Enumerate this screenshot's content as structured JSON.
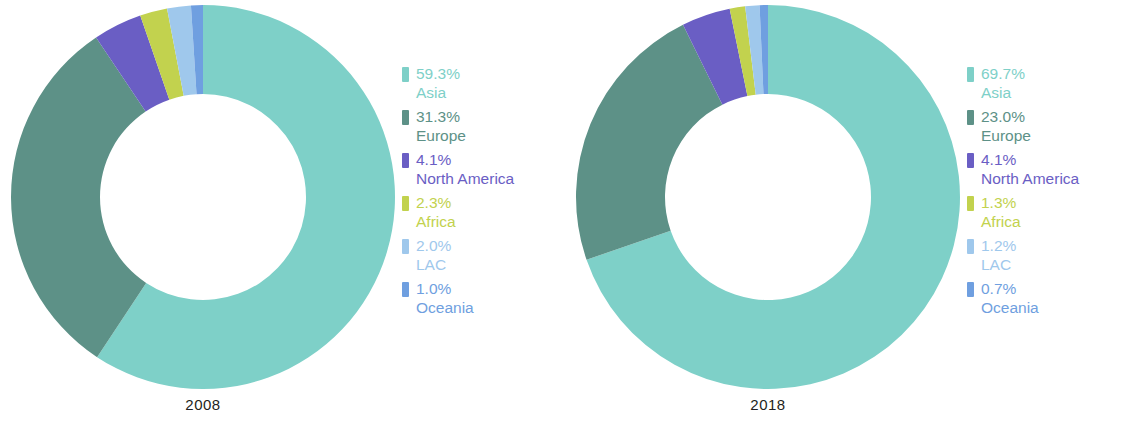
{
  "chart_data": [
    {
      "type": "pie",
      "title": "2008",
      "subtitle": "",
      "xlabel": "",
      "ylabel": "",
      "donut": true,
      "legend_position": "right",
      "grid": false,
      "categories": [
        "Asia",
        "Europe",
        "North America",
        "Africa",
        "LAC",
        "Oceania"
      ],
      "values": [
        59.3,
        31.3,
        4.1,
        2.3,
        2.0,
        1.0
      ],
      "value_labels": [
        "59.3%",
        "31.3%",
        "4.1%",
        "2.3%",
        "2.0%",
        "1.0%"
      ],
      "colors": [
        "#7ed0c8",
        "#5d9187",
        "#6a5ec4",
        "#c2d24e",
        "#9fc8ec",
        "#6f9fe0"
      ]
    },
    {
      "type": "pie",
      "title": "2018",
      "subtitle": "",
      "xlabel": "",
      "ylabel": "",
      "donut": true,
      "legend_position": "right",
      "grid": false,
      "categories": [
        "Asia",
        "Europe",
        "North America",
        "Africa",
        "LAC",
        "Oceania"
      ],
      "values": [
        69.7,
        23.0,
        4.1,
        1.3,
        1.2,
        0.7
      ],
      "value_labels": [
        "69.7%",
        "23.0%",
        "4.1%",
        "1.3%",
        "1.2%",
        "0.7%"
      ],
      "colors": [
        "#7ed0c8",
        "#5d9187",
        "#6a5ec4",
        "#c2d24e",
        "#9fc8ec",
        "#6f9fe0"
      ]
    }
  ],
  "charts": [
    {
      "year_label": "2008",
      "legend": [
        {
          "pct": "59.3%",
          "name": "Asia",
          "color": "#7ed0c8"
        },
        {
          "pct": "31.3%",
          "name": "Europe",
          "color": "#5d9187"
        },
        {
          "pct": "4.1%",
          "name": "North America",
          "color": "#6a5ec4"
        },
        {
          "pct": "2.3%",
          "name": "Africa",
          "color": "#c2d24e"
        },
        {
          "pct": "2.0%",
          "name": "LAC",
          "color": "#9fc8ec"
        },
        {
          "pct": "1.0%",
          "name": "Oceania",
          "color": "#6f9fe0"
        }
      ]
    },
    {
      "year_label": "2018",
      "legend": [
        {
          "pct": "69.7%",
          "name": "Asia",
          "color": "#7ed0c8"
        },
        {
          "pct": "23.0%",
          "name": "Europe",
          "color": "#5d9187"
        },
        {
          "pct": "4.1%",
          "name": "North America",
          "color": "#6a5ec4"
        },
        {
          "pct": "1.3%",
          "name": "Africa",
          "color": "#c2d24e"
        },
        {
          "pct": "1.2%",
          "name": "LAC",
          "color": "#9fc8ec"
        },
        {
          "pct": "0.7%",
          "name": "Oceania",
          "color": "#6f9fe0"
        }
      ]
    }
  ]
}
